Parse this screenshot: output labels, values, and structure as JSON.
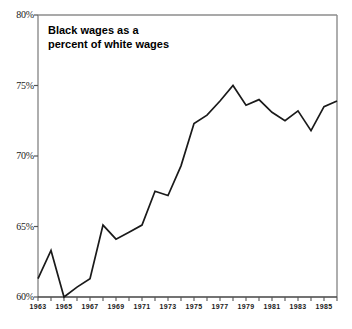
{
  "figure": {
    "top_clipped_text": "",
    "title": "Black wages as a\npercent of white wages",
    "line_color": "#1a1a1a",
    "frame_color": "#8c8c8c",
    "axis_color": "#555555",
    "text_color": "#1a1a1a",
    "background": "#ffffff"
  },
  "chart_data": {
    "type": "line",
    "title": "Black wages as a percent of white wages",
    "xlabel": "",
    "ylabel": "",
    "ylim": [
      60,
      80
    ],
    "xlim": [
      1963,
      1986
    ],
    "grid": false,
    "legend": null,
    "y_ticks": [
      60,
      65,
      70,
      75,
      80
    ],
    "y_tick_labels": [
      "60%",
      "65%",
      "70%",
      "75%",
      "80%"
    ],
    "x_ticks": [
      1963,
      1964,
      1965,
      1966,
      1967,
      1968,
      1969,
      1970,
      1971,
      1972,
      1973,
      1974,
      1975,
      1976,
      1977,
      1978,
      1979,
      1980,
      1981,
      1982,
      1983,
      1984,
      1985,
      1986
    ],
    "x_tick_labels": [
      "1963",
      "1965",
      "1967",
      "1969",
      "1971",
      "1973",
      "1975",
      "1977",
      "1979",
      "1981",
      "1983",
      "1985"
    ],
    "x_labeled_ticks": [
      1963,
      1965,
      1967,
      1969,
      1971,
      1973,
      1975,
      1977,
      1979,
      1981,
      1983,
      1985
    ],
    "x": [
      1963,
      1964,
      1965,
      1966,
      1967,
      1968,
      1969,
      1970,
      1971,
      1972,
      1973,
      1974,
      1975,
      1976,
      1977,
      1978,
      1979,
      1980,
      1981,
      1982,
      1983,
      1984,
      1985,
      1986
    ],
    "values": [
      61.3,
      63.3,
      60.0,
      60.7,
      61.3,
      65.1,
      64.1,
      64.6,
      65.1,
      67.5,
      67.2,
      69.3,
      72.3,
      72.9,
      73.9,
      75.0,
      73.6,
      74.0,
      73.1,
      72.5,
      73.2,
      71.8,
      73.5,
      73.9
    ],
    "series": [
      {
        "name": "Black wages as a percent of white wages",
        "values": [
          61.3,
          63.3,
          60.0,
          60.7,
          61.3,
          65.1,
          64.1,
          64.6,
          65.1,
          67.5,
          67.2,
          69.3,
          72.3,
          72.9,
          73.9,
          75.0,
          73.6,
          74.0,
          73.1,
          72.5,
          73.2,
          71.8,
          73.5,
          73.9
        ]
      }
    ]
  }
}
